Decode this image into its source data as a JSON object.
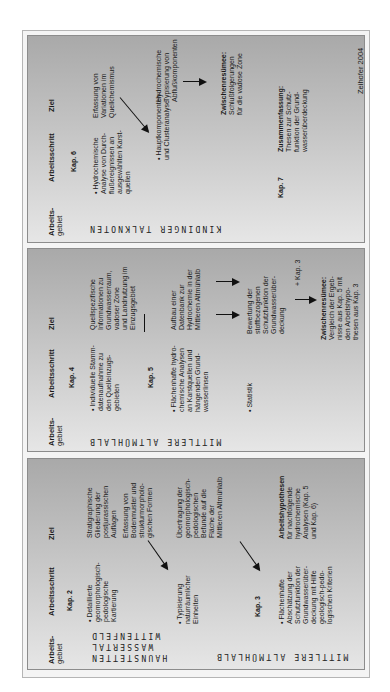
{
  "headers": {
    "area": [
      "Arbeits-",
      "gebiet"
    ],
    "step": "Arbeitsschritt",
    "goal": "Ziel"
  },
  "panel_top": {
    "region": "KINDINGER TALKNOTEN",
    "kap6": "Kap. 6",
    "kap7": "Kap. 7",
    "step1": [
      "• Hydrochemische",
      "Analyse von Durch-",
      "flußereignissen an",
      "ausgewählten Karst-",
      "quellen"
    ],
    "step2": [
      "• Hauptkomponenten-",
      "und Clusteranalyse"
    ],
    "goal1": [
      "Erfassung von",
      "Variationen im",
      "Quellchemismus"
    ],
    "goal2": [
      "Hydrochemische",
      "Typisierung von",
      "Abflußkomponenten"
    ],
    "interim": [
      "Zwischenresümee:",
      "Schlußfolgerungen",
      "für die vadose Zone"
    ],
    "summary": [
      "Zusammenfassung:",
      "Thesen zur Schutz-",
      "funktion der Grund-",
      "wasserüberdeckung"
    ],
    "credit": "Zeihofer 2004"
  },
  "panel_mid": {
    "region": "MITTLERE ALTMÜHLALB",
    "kap4": "Kap. 4",
    "kap5": "Kap. 5",
    "step1": [
      "• Individuelle Stamm-",
      "datenaufnahme zu",
      "den Quelleinzugs-",
      "gebieten"
    ],
    "step2": [
      "• Flächenhafte hydro-",
      "chemische Analysen",
      "an Karstquellen und",
      "hängenden Grund-",
      "wasserlinsen"
    ],
    "step3": "• Statistik",
    "goal1": [
      "Quellspezifische",
      "Informationen zu",
      "Grundwasserraum,",
      "vadoser Zone",
      "und Landnutzung im",
      "Einzugsgebiet"
    ],
    "goal2": [
      "Aufbau einer",
      "Datenbank zur",
      "Hydrochemie in der",
      "Mittleren Altmühlalb"
    ],
    "eval": [
      "Bewertung der",
      "stoffbezogenen",
      "Schutzfunktion der",
      "Grundwasserüber-",
      "deckung"
    ],
    "kap3_ref": "+ Kap. 3",
    "interim": [
      "Zwischenresümee:",
      "Vergleich der Ergeb-",
      "nisse aus Kap. 5 mit",
      "den Arbeitshypo-",
      "thesen aus Kap. 3"
    ]
  },
  "panel_bot": {
    "region1": [
      "HAUNSTETTEN",
      "WASSERTAL",
      "WITTENFELD"
    ],
    "region2": "MITTLERE ALTMÜHLALB",
    "kap2": "Kap. 2",
    "kap3": "Kap. 3",
    "step1": [
      "• Detaillierte",
      "geomorphologisch-",
      "pedologische",
      "Kartierung"
    ],
    "step2": [
      "• Typisierung",
      "naturräumlicher",
      "Einheiten"
    ],
    "step3": [
      "• Flächenhafte",
      "Abschätzung der",
      "Schutzfunktion der",
      "Grundwasserüber-",
      "deckung mit Hilfe",
      "geologisch-pedo-",
      "logischen Kriterien"
    ],
    "goal1": [
      "Stratigraphische",
      "Gliederung der",
      "postjurassischen",
      "Auflagen"
    ],
    "goal2": [
      "Erfassung von",
      "Bodenmuster und",
      "strukturmorpholo-",
      "gischen Formen"
    ],
    "goal3": [
      "Übertragung der",
      "geomorphologisch-",
      "pedologischen",
      "Befunde auf die",
      "Fläche der",
      "Mittleren Altmühlalb"
    ],
    "hypo": [
      "Arbeitshypothesen",
      "für nachfolgende",
      "hydrochemische",
      "Analysen (Kap. 5",
      "und Kap. 6)"
    ]
  }
}
